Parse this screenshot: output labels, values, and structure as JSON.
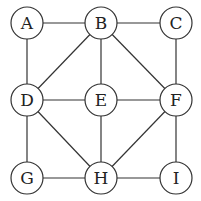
{
  "graph": {
    "nodes": [
      {
        "id": "A",
        "x": 27,
        "y": 23
      },
      {
        "id": "B",
        "x": 101,
        "y": 23
      },
      {
        "id": "C",
        "x": 176,
        "y": 23
      },
      {
        "id": "D",
        "x": 27,
        "y": 100
      },
      {
        "id": "E",
        "x": 101,
        "y": 100
      },
      {
        "id": "F",
        "x": 176,
        "y": 100
      },
      {
        "id": "G",
        "x": 27,
        "y": 178
      },
      {
        "id": "H",
        "x": 101,
        "y": 178
      },
      {
        "id": "I",
        "x": 176,
        "y": 178
      }
    ],
    "edges": [
      [
        "A",
        "B"
      ],
      [
        "B",
        "C"
      ],
      [
        "A",
        "D"
      ],
      [
        "B",
        "D"
      ],
      [
        "B",
        "E"
      ],
      [
        "B",
        "F"
      ],
      [
        "C",
        "F"
      ],
      [
        "D",
        "E"
      ],
      [
        "E",
        "F"
      ],
      [
        "D",
        "G"
      ],
      [
        "D",
        "H"
      ],
      [
        "E",
        "H"
      ],
      [
        "F",
        "H"
      ],
      [
        "F",
        "I"
      ],
      [
        "G",
        "H"
      ],
      [
        "H",
        "I"
      ]
    ],
    "node_radius": 16,
    "stroke_color": "#333333"
  },
  "labels": {
    "A": "A",
    "B": "B",
    "C": "C",
    "D": "D",
    "E": "E",
    "F": "F",
    "G": "G",
    "H": "H",
    "I": "I"
  }
}
